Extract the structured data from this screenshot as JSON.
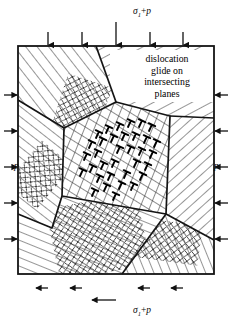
{
  "figure": {
    "name": "polycrystal-dislocation-glide-diagram",
    "width": 232,
    "height": 333,
    "background": "#ffffff",
    "line_color": "#1a1a1a",
    "hatch_color": "#3a3a3a"
  },
  "labels": {
    "top": {
      "sigma": "σ",
      "subscript": "1",
      "operator": "+",
      "pressure": "p"
    },
    "bottom": {
      "sigma": "σ",
      "subscript": "1",
      "operator": "+",
      "pressure": "p"
    },
    "left": "p",
    "right": "p"
  },
  "caption": {
    "lines": [
      "dislocation",
      "glide on",
      "intersecting",
      "planes"
    ],
    "line1": "dislocation",
    "line2": "glide on",
    "line3": "intersecting",
    "line4": "planes"
  },
  "loading": {
    "top_arrow_count": 5,
    "bottom_arrow_count": 5,
    "left_arrow_count": 5,
    "right_arrow_count": 5,
    "top_direction": "down",
    "bottom_direction": "up",
    "left_direction": "right",
    "right_direction": "left",
    "top_arrow_x": [
      82,
      116,
      150,
      183,
      48
    ],
    "side_arrow_y": [
      95,
      131,
      167,
      203,
      239
    ]
  },
  "specimen": {
    "outline": "18,46 214,46 214,274 18,274",
    "left": 18,
    "top": 46,
    "right": 214,
    "bottom": 274
  },
  "grains": [
    {
      "id": "grain-upper-left",
      "hatch_angle": -38,
      "hatch_spacing": 9,
      "points": "18,46 96,46 116,102 64,128 18,100"
    },
    {
      "id": "grain-upper-right",
      "hatch_angle": 62,
      "hatch_spacing": 9,
      "points": "96,46 214,46 214,118 170,116 116,102"
    },
    {
      "id": "grain-left",
      "hatch_angle": -52,
      "hatch_spacing": 8,
      "points": "18,100 64,128 62,196 52,228 18,214"
    },
    {
      "id": "grain-right",
      "hatch_angle": 48,
      "hatch_spacing": 8,
      "points": "170,116 214,118 214,240 166,214"
    },
    {
      "id": "grain-lower-left",
      "hatch_angle": -68,
      "hatch_spacing": 8,
      "points": "18,214 52,228 62,196 166,214 122,274 18,274"
    },
    {
      "id": "grain-lower-right",
      "hatch_angle": -22,
      "hatch_spacing": 8,
      "points": "166,214 214,240 214,274 122,274"
    },
    {
      "id": "grain-center",
      "hatch_angle": 0,
      "hatch_spacing": 0,
      "points": "64,128 116,102 170,116 166,214 62,196"
    }
  ],
  "central_grain": {
    "name": "central-grain-with-dislocations",
    "slip_family_1_angle": 22,
    "slip_family_2_angle": -58,
    "slip_line_spacing": 9,
    "dislocation_symbol": "inverted-tee",
    "dislocation_count": 34
  },
  "colors": {
    "stroke": "#141414",
    "hatch": "#3d3d3d",
    "slip": "#2b2b2b",
    "dislocation": "#000000"
  }
}
